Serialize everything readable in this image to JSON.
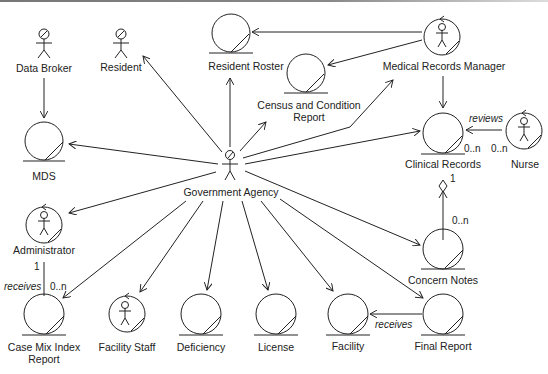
{
  "diagram": {
    "type": "UML robustness / analysis diagram",
    "nodes": [
      {
        "id": "data_broker",
        "kind": "actor",
        "label": "Data Broker"
      },
      {
        "id": "resident",
        "kind": "actor",
        "label": "Resident"
      },
      {
        "id": "resident_roster",
        "kind": "entity",
        "label": "Resident Roster"
      },
      {
        "id": "census_report",
        "kind": "entity",
        "label_lines": [
          "Census and Condition",
          "Report"
        ]
      },
      {
        "id": "medical_records_manager",
        "kind": "actor-control",
        "label": "Medical Records Manager"
      },
      {
        "id": "mds",
        "kind": "entity",
        "label": "MDS"
      },
      {
        "id": "government_agency",
        "kind": "actor",
        "label": "Government Agency"
      },
      {
        "id": "clinical_records",
        "kind": "entity",
        "label": "Clinical Records"
      },
      {
        "id": "nurse",
        "kind": "actor-control",
        "label": "Nurse"
      },
      {
        "id": "administrator",
        "kind": "actor-control",
        "label": "Administrator"
      },
      {
        "id": "concern_notes",
        "kind": "entity",
        "label": "Concern Notes"
      },
      {
        "id": "case_mix_index_report",
        "kind": "entity",
        "label_lines": [
          "Case Mix Index",
          "Report"
        ]
      },
      {
        "id": "facility_staff",
        "kind": "actor-control",
        "label": "Facility Staff"
      },
      {
        "id": "deficiency",
        "kind": "entity",
        "label": "Deficiency"
      },
      {
        "id": "license",
        "kind": "entity",
        "label": "License"
      },
      {
        "id": "facility",
        "kind": "entity",
        "label": "Facility"
      },
      {
        "id": "final_report",
        "kind": "entity",
        "label": "Final Report"
      }
    ],
    "edges": [
      {
        "from": "data_broker",
        "to": "mds"
      },
      {
        "from": "government_agency",
        "to": "resident"
      },
      {
        "from": "government_agency",
        "to": "resident_roster"
      },
      {
        "from": "government_agency",
        "to": "census_report"
      },
      {
        "from": "government_agency",
        "to": "medical_records_manager"
      },
      {
        "from": "government_agency",
        "to": "mds"
      },
      {
        "from": "government_agency",
        "to": "clinical_records"
      },
      {
        "from": "government_agency",
        "to": "administrator"
      },
      {
        "from": "government_agency",
        "to": "concern_notes"
      },
      {
        "from": "government_agency",
        "to": "case_mix_index_report"
      },
      {
        "from": "government_agency",
        "to": "facility_staff"
      },
      {
        "from": "government_agency",
        "to": "deficiency"
      },
      {
        "from": "government_agency",
        "to": "license"
      },
      {
        "from": "government_agency",
        "to": "facility"
      },
      {
        "from": "government_agency",
        "to": "final_report"
      },
      {
        "from": "medical_records_manager",
        "to": "resident_roster"
      },
      {
        "from": "medical_records_manager",
        "to": "census_report"
      },
      {
        "from": "medical_records_manager",
        "to": "clinical_records"
      },
      {
        "from": "nurse",
        "to": "clinical_records",
        "label": "reviews",
        "mult_from": "0..n",
        "mult_to": "0..n"
      },
      {
        "from": "concern_notes",
        "to": "clinical_records",
        "aggregation": true,
        "mult_from": "0..n",
        "mult_to": "1"
      },
      {
        "from": "administrator",
        "to": "case_mix_index_report",
        "label": "receives",
        "mult_from": "1",
        "mult_to": "0..n"
      },
      {
        "from": "final_report",
        "to": "facility",
        "label": "receives"
      }
    ],
    "edge_labels": {
      "reviews": "reviews",
      "receives_admin": "receives",
      "receives_facility": "receives"
    },
    "multiplicities": {
      "clinical_nurse_end": "0..n",
      "nurse_end": "0..n",
      "clinical_agg_end": "1",
      "concern_end": "0..n",
      "admin_end": "1",
      "casemix_end": "0..n"
    }
  }
}
